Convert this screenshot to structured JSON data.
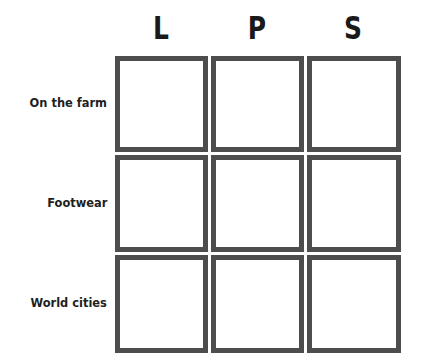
{
  "grid": {
    "columns": [
      {
        "label": "L"
      },
      {
        "label": "P"
      },
      {
        "label": "S"
      }
    ],
    "rows": [
      {
        "label": "On the farm",
        "cells": [
          "",
          "",
          ""
        ]
      },
      {
        "label": "Footwear",
        "cells": [
          "",
          "",
          ""
        ]
      },
      {
        "label": "World cities",
        "cells": [
          "",
          "",
          ""
        ]
      }
    ]
  },
  "colors": {
    "border": "#4d4d4d",
    "text": "#1f1f1f",
    "background": "#ffffff"
  }
}
